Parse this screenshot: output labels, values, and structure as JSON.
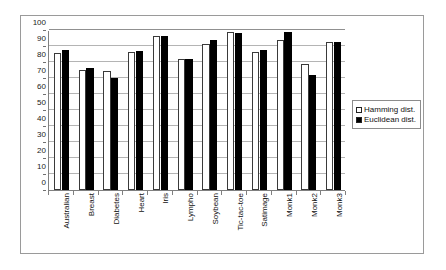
{
  "chart_data": {
    "type": "bar",
    "title": "",
    "subtitle": "",
    "xlabel": "",
    "ylabel": "",
    "ylim": [
      0,
      100
    ],
    "ytick_step": 10,
    "yticks": [
      0,
      10,
      20,
      30,
      40,
      50,
      60,
      70,
      80,
      90,
      100
    ],
    "grid": true,
    "grid_axis": "y",
    "legend_position": "right",
    "categories": [
      "Australian",
      "Breast",
      "Diabetes",
      "Heart",
      "Iris",
      "Lympho",
      "Soybean",
      "Tic-tac-toe",
      "Satimage",
      "Monk1",
      "Monk2",
      "Monk3"
    ],
    "series": [
      {
        "name": "Hamming dist.",
        "color": "#ffffff",
        "edge_color": "#000000",
        "values": [
          85.5,
          75.0,
          74.5,
          86.0,
          96.5,
          82.0,
          91.5,
          98.5,
          86.5,
          93.5,
          79.0,
          92.5
        ]
      },
      {
        "name": "Euclidean dist.",
        "color": "#000000",
        "edge_color": "#000000",
        "values": [
          87.5,
          76.0,
          70.0,
          87.0,
          96.5,
          82.0,
          93.5,
          98.0,
          87.5,
          98.5,
          72.0,
          92.5
        ]
      }
    ]
  },
  "legend": {
    "items": [
      {
        "label": "Hamming dist.",
        "swatch": "hollow-square-icon"
      },
      {
        "label": "Euclidean dist.",
        "swatch": "filled-square-icon"
      }
    ]
  },
  "axes": {
    "y_tick_labels": [
      "100",
      "90",
      "80",
      "70",
      "60",
      "50",
      "40",
      "30",
      "20",
      "10",
      "0"
    ]
  }
}
